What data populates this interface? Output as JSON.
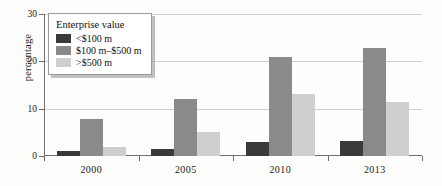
{
  "chart_data": {
    "type": "bar",
    "title": "",
    "subtitle": "",
    "xlabel": "",
    "ylabel": "percentage",
    "categories": [
      "2000",
      "2005",
      "2010",
      "2013"
    ],
    "ylim": [
      0,
      30
    ],
    "yticks": [
      0,
      10,
      20,
      30
    ],
    "ytick_labels": [
      "0",
      "10",
      "20",
      "30"
    ],
    "grid": true,
    "legend_position": "top-left",
    "legend_title": "Enterprise value",
    "series": [
      {
        "name": "<$100 m",
        "color": "#3a3a3a",
        "values": [
          1,
          1.5,
          3,
          3.2
        ]
      },
      {
        "name": "$100 m–$500 m",
        "color": "#8a8a8a",
        "values": [
          7.8,
          12,
          21,
          22.8
        ]
      },
      {
        "name": ">$500 m",
        "color": "#cfcfcf",
        "values": [
          2,
          5,
          13,
          11.5
        ]
      }
    ]
  },
  "axis": {
    "y_title": "percentage"
  }
}
